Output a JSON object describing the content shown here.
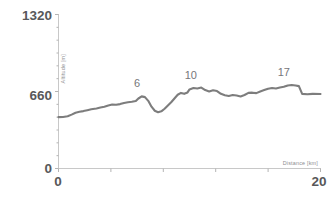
{
  "chart_data": {
    "type": "line",
    "title": "",
    "subtitle": "",
    "xlabel": "Distance [km]",
    "ylabel": "Altitude [m]",
    "xlim": [
      0,
      20
    ],
    "ylim": [
      0,
      1320
    ],
    "grid": false,
    "legend": null,
    "x_ticks": [
      0,
      4,
      8,
      12,
      16,
      20
    ],
    "x_tick_labels": [
      "0",
      "20"
    ],
    "y_ticks": [
      0,
      660,
      1320
    ],
    "y_tick_labels": [
      "0",
      "660",
      "1320"
    ],
    "y_minor_ticks": [
      110,
      220,
      330,
      440,
      550,
      770,
      880,
      990,
      1100,
      1210
    ],
    "series": [
      {
        "name": "Altitude profile",
        "color": "#7d7d7d",
        "x": [
          0.0,
          0.35,
          0.7,
          1.0,
          1.3,
          1.6,
          1.9,
          2.2,
          2.5,
          2.9,
          3.2,
          3.5,
          3.8,
          4.1,
          4.4,
          4.7,
          5.0,
          5.3,
          5.6,
          5.9,
          6.1,
          6.35,
          6.6,
          6.85,
          7.1,
          7.35,
          7.6,
          7.85,
          8.1,
          8.35,
          8.6,
          8.85,
          9.1,
          9.35,
          9.6,
          9.85,
          10.0,
          10.3,
          10.6,
          10.9,
          11.2,
          11.5,
          11.8,
          12.1,
          12.4,
          12.7,
          13.0,
          13.3,
          13.6,
          13.9,
          14.2,
          14.5,
          14.8,
          15.1,
          15.4,
          15.7,
          16.0,
          16.3,
          16.6,
          16.9,
          17.2,
          17.5,
          17.8,
          18.1,
          18.35,
          18.6,
          19.0,
          19.4,
          20.0
        ],
        "y": [
          440,
          442,
          448,
          462,
          478,
          486,
          492,
          500,
          508,
          515,
          523,
          530,
          540,
          548,
          546,
          552,
          562,
          568,
          572,
          578,
          600,
          618,
          612,
          580,
          530,
          495,
          482,
          490,
          512,
          540,
          568,
          600,
          632,
          648,
          640,
          652,
          678,
          690,
          686,
          694,
          672,
          660,
          670,
          664,
          640,
          628,
          622,
          630,
          626,
          618,
          630,
          648,
          650,
          646,
          660,
          672,
          684,
          690,
          686,
          694,
          700,
          712,
          716,
          712,
          706,
          640,
          636,
          640,
          638
        ],
        "annotations": [
          {
            "label": "6",
            "x": 6.0,
            "y": 620
          },
          {
            "label": "10",
            "x": 10.1,
            "y": 690
          },
          {
            "label": "17",
            "x": 17.2,
            "y": 716
          }
        ]
      }
    ]
  },
  "axis": {
    "y_label": "Altitude [m]",
    "x_label": "Distance [km]",
    "y_top": "1320",
    "y_mid": "660",
    "y_zero": "0",
    "x_start": "0",
    "x_end": "20"
  },
  "colors": {
    "line": "#7d7d7d",
    "axis": "#c8c8c8",
    "value_text": "#58585a",
    "axis_title": "#8d8d8f",
    "annotation": "#76767a",
    "background": "#ffffff"
  }
}
